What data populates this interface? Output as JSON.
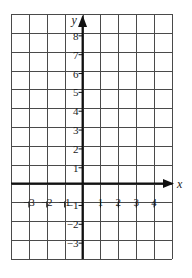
{
  "diagram": {
    "type": "coordinate-grid",
    "grid": {
      "left": 11,
      "top": 14,
      "right": 172,
      "bottom": 259,
      "columns": 9,
      "rows": 13,
      "line_color": "#4a4a4a"
    },
    "axes": {
      "color": "#111111",
      "x_axis": {
        "label": "x",
        "min": -4,
        "max": 5,
        "origin_col": 4
      },
      "y_axis": {
        "label": "y",
        "min": -4,
        "max": 9,
        "origin_row": 9
      }
    },
    "x_ticks": [
      {
        "value": -3,
        "label": "−3"
      },
      {
        "value": -2,
        "label": "−2"
      },
      {
        "value": -1,
        "label": "−1"
      },
      {
        "value": 1,
        "label": "1"
      },
      {
        "value": 2,
        "label": "2"
      },
      {
        "value": 3,
        "label": "3"
      },
      {
        "value": 4,
        "label": "4"
      }
    ],
    "y_ticks": [
      {
        "value": 8,
        "label": "8"
      },
      {
        "value": 7,
        "label": "7"
      },
      {
        "value": 6,
        "label": "6"
      },
      {
        "value": 5,
        "label": "5"
      },
      {
        "value": 4,
        "label": "4"
      },
      {
        "value": 3,
        "label": "3"
      },
      {
        "value": 2,
        "label": "2"
      },
      {
        "value": 1,
        "label": "1"
      },
      {
        "value": -1,
        "label": "−1"
      },
      {
        "value": -2,
        "label": "−2"
      },
      {
        "value": -3,
        "label": "−3"
      }
    ]
  }
}
